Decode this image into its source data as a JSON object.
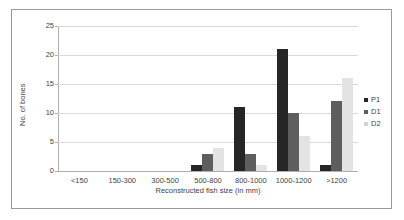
{
  "chart_data": {
    "type": "bar",
    "title": "",
    "xlabel": "Reconstructed fish size (in mm)",
    "ylabel": "No. of bones",
    "categories": [
      "<150",
      "150-300",
      "300-500",
      "500-800",
      "800-1000",
      "1000-1200",
      ">1200"
    ],
    "series": [
      {
        "name": "P1",
        "color": "#262626",
        "values": [
          0,
          0,
          0,
          1,
          11,
          21,
          1
        ]
      },
      {
        "name": "D1",
        "color": "#5e5e5e",
        "values": [
          0,
          0,
          0,
          3,
          3,
          10,
          12
        ]
      },
      {
        "name": "D2",
        "color": "#e3e3e3",
        "values": [
          0,
          0,
          0,
          4,
          1,
          6,
          16
        ]
      }
    ],
    "ylim": [
      0,
      25
    ],
    "yticks": [
      0,
      5,
      10,
      15,
      20,
      25
    ],
    "ytick_labels": [
      "0",
      "5",
      "10",
      "15",
      "20",
      "25"
    ],
    "grid": true,
    "grid_axis": "y",
    "legend_position": "right",
    "legend_entries": [
      "P1",
      "D1",
      "D2"
    ]
  },
  "frame": {
    "border_color": "#9a9a9a",
    "background": "#ffffff"
  }
}
